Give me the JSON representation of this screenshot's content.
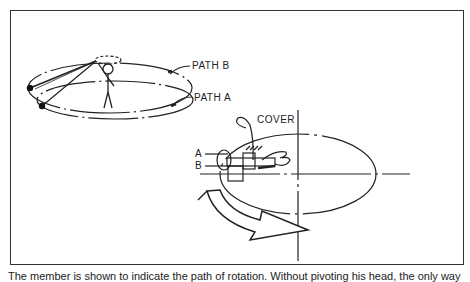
{
  "figure": {
    "labels": {
      "path_b": "PATH B",
      "path_a": "PATH A",
      "cover": "COVER",
      "a": "A",
      "b": "B"
    },
    "caption": "The member is shown to indicate the path of rotation. Without pivoting his head, the only way"
  }
}
